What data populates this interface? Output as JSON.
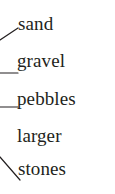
{
  "figure": {
    "name": "sediment-size-labels",
    "background_color": "#ffffff",
    "text_color": "#231f20",
    "line_color": "#231f20"
  },
  "labels": [
    {
      "id": "sand",
      "text": "sand"
    },
    {
      "id": "gravel",
      "text": "gravel"
    },
    {
      "id": "pebbles",
      "text": "pebbles"
    },
    {
      "id": "larger-stones",
      "text_line1": "larger",
      "text_line2": "stones"
    }
  ],
  "leader_lines": [
    {
      "id": "leader-sand",
      "target": "sand",
      "x1": 0,
      "y1": 40,
      "x2": 18,
      "y2": 28
    },
    {
      "id": "leader-gravel",
      "target": "gravel",
      "x1": 0,
      "y1": 73,
      "x2": 18,
      "y2": 73
    },
    {
      "id": "leader-pebbles",
      "target": "pebbles",
      "x1": 0,
      "y1": 107,
      "x2": 18,
      "y2": 107
    },
    {
      "id": "leader-larger-stones",
      "target": "larger-stones",
      "x1": 0,
      "y1": 157,
      "x2": 20,
      "y2": 180
    }
  ]
}
